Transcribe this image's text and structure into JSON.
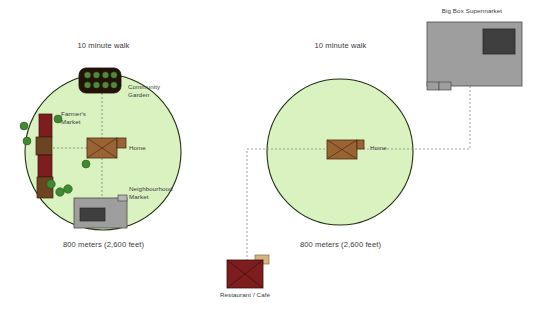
{
  "figure": {
    "title_left": "10 minute walk",
    "title_right": "10 minute walk",
    "scale_left": "800 meters (2,600 feet)",
    "scale_right": "800 meters (2,600 feet)"
  },
  "colors": {
    "circle_fill": "#d9f2c0",
    "circle_stroke": "#20300f",
    "home_fill": "#9a6334",
    "home_stroke": "#4a2e12",
    "market_red": "#7e1d1d",
    "market_brown": "#6b4422",
    "garden_fill": "#241208",
    "garden_dot": "#4d8a3a",
    "tree_green": "#3f8a33",
    "gray_building": "#9e9e9e",
    "gray_dark": "#3f3f3f",
    "gray_stroke": "#4a4a4a",
    "restaurant_fill": "#7e1d1d",
    "restaurant_annex": "#d4b483",
    "dash_line": "#8c8c8c",
    "label_text": "#3a3a3a"
  },
  "left_scene": {
    "name": "walkable-neighbourhood",
    "circle": {
      "cx": 103,
      "cy": 152,
      "r": 78
    },
    "labels": [
      {
        "key": "community_garden",
        "text": "Community\nGarden",
        "x": 128,
        "y": 84
      },
      {
        "key": "farmers_market",
        "text": "Farmer's\nMarket",
        "x": 61,
        "y": 110
      },
      {
        "key": "home",
        "text": "Home",
        "x": 129,
        "y": 145
      },
      {
        "key": "neighbourhood_market",
        "text": "Neighbourhood\nMarket",
        "x": 130,
        "y": 186
      }
    ],
    "features": {
      "community_garden": {
        "x": 79,
        "y": 68,
        "w": 42,
        "h": 25,
        "rows": 2,
        "cols": 4
      },
      "home": {
        "x": 87,
        "y": 138,
        "w": 30,
        "h": 20
      },
      "neighbourhood_market": {
        "x": 74,
        "y": 198,
        "w": 53,
        "h": 30
      },
      "trees": [
        {
          "x": 24,
          "y": 125
        },
        {
          "x": 28,
          "y": 140
        },
        {
          "x": 57,
          "y": 119
        },
        {
          "x": 85,
          "y": 164
        },
        {
          "x": 52,
          "y": 183
        },
        {
          "x": 59,
          "y": 191
        },
        {
          "x": 67,
          "y": 189
        }
      ]
    }
  },
  "right_scene": {
    "name": "car-dependent-neighbourhood",
    "circle": {
      "cx": 340,
      "cy": 152,
      "r": 73
    },
    "labels": [
      {
        "key": "home",
        "text": "Home",
        "x": 370,
        "y": 145
      },
      {
        "key": "big_box_supermarket",
        "text": "Big Box Supermarket",
        "x": 441,
        "y": 8
      },
      {
        "key": "restaurant_cafe",
        "text": "Restaurant / Café",
        "x": 216,
        "y": 292
      }
    ],
    "features": {
      "home": {
        "x": 327,
        "y": 140,
        "w": 30,
        "h": 19
      },
      "big_box_supermarket": {
        "x": 427,
        "y": 22,
        "w": 95,
        "h": 64
      },
      "restaurant_cafe": {
        "x": 227,
        "y": 258,
        "w": 36,
        "h": 30
      }
    }
  }
}
